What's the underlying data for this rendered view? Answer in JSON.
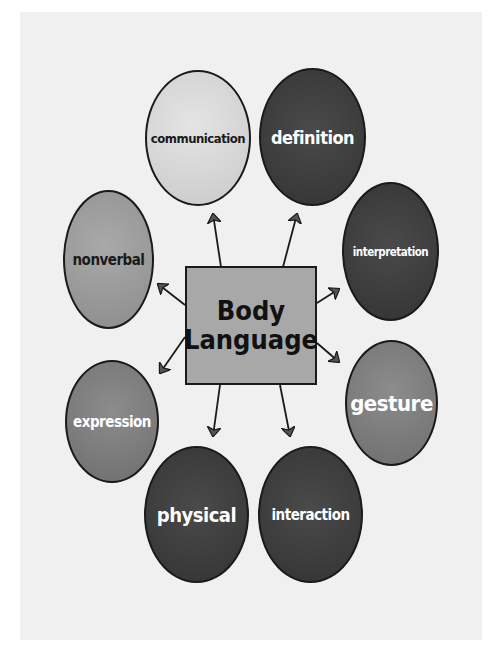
{
  "diagram": {
    "center": {
      "line1": "Body",
      "line2": "Language"
    },
    "nodes": [
      {
        "id": "communication",
        "label": "communication",
        "shade": "light"
      },
      {
        "id": "definition",
        "label": "definition",
        "shade": "dark"
      },
      {
        "id": "interpretation",
        "label": "interpretation",
        "shade": "dark"
      },
      {
        "id": "gesture",
        "label": "gesture",
        "shade": "midlight"
      },
      {
        "id": "interaction",
        "label": "interaction",
        "shade": "dark"
      },
      {
        "id": "physical",
        "label": "physical",
        "shade": "dark"
      },
      {
        "id": "expression",
        "label": "expression",
        "shade": "midlight"
      },
      {
        "id": "nonverbal",
        "label": "nonverbal",
        "shade": "mid"
      }
    ],
    "edges": [
      {
        "from": "center",
        "to": "communication"
      },
      {
        "from": "center",
        "to": "definition"
      },
      {
        "from": "center",
        "to": "interpretation"
      },
      {
        "from": "center",
        "to": "gesture"
      },
      {
        "from": "center",
        "to": "interaction"
      },
      {
        "from": "center",
        "to": "physical"
      },
      {
        "from": "center",
        "to": "expression"
      },
      {
        "from": "center",
        "to": "nonverbal"
      }
    ],
    "colors": {
      "background": "#f0f0f0",
      "center_fill": "#a8a8a8",
      "light_fill": "#d6d6d6",
      "mid_fill": "#9a9a9a",
      "midlight_fill": "#7d7d7d",
      "dark_fill": "#3d3d3d",
      "outline": "#1a1a1a"
    }
  }
}
